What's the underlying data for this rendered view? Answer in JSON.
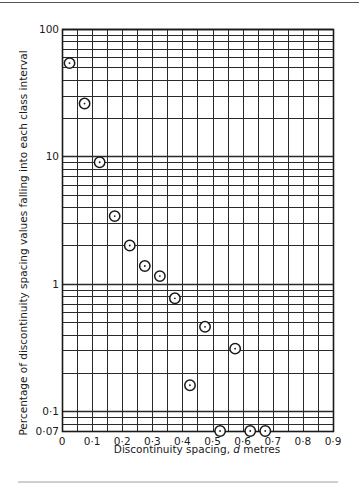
{
  "chart_data": {
    "type": "scatter",
    "title": "",
    "xlabel": "Discontinuity spacing, d metres",
    "xlabel_parts": [
      "Discontinuity spacing, ",
      "d",
      " metres"
    ],
    "ylabel": "Percentage of discontinuity spacing values falling into each class interval",
    "xlim": [
      0,
      0.9
    ],
    "ylim": [
      0.07,
      100
    ],
    "yscale": "log",
    "grid": true,
    "x_ticks": [
      {
        "v": 0,
        "label": "0"
      },
      {
        "v": 0.1,
        "label": "0·1"
      },
      {
        "v": 0.2,
        "label": "0·2"
      },
      {
        "v": 0.3,
        "label": "0·3"
      },
      {
        "v": 0.4,
        "label": "0·4"
      },
      {
        "v": 0.5,
        "label": "0·5"
      },
      {
        "v": 0.6,
        "label": "0·6"
      },
      {
        "v": 0.7,
        "label": "0·7"
      },
      {
        "v": 0.8,
        "label": "0·8"
      },
      {
        "v": 0.9,
        "label": "0·9"
      }
    ],
    "x_minor_step": 0.05,
    "y_ticks": [
      {
        "v": 100,
        "label": "100"
      },
      {
        "v": 10,
        "label": "10"
      },
      {
        "v": 1,
        "label": "1"
      },
      {
        "v": 0.1,
        "label": "0·1"
      },
      {
        "v": 0.07,
        "label": "0·07"
      }
    ],
    "marker": "circled-dot",
    "series": [
      {
        "name": "Discontinuity spacing frequency",
        "points": [
          {
            "x": 0.025,
            "y": 54
          },
          {
            "x": 0.075,
            "y": 26
          },
          {
            "x": 0.125,
            "y": 9.0
          },
          {
            "x": 0.175,
            "y": 3.4
          },
          {
            "x": 0.225,
            "y": 2.0
          },
          {
            "x": 0.275,
            "y": 1.38
          },
          {
            "x": 0.325,
            "y": 1.15
          },
          {
            "x": 0.375,
            "y": 0.77
          },
          {
            "x": 0.425,
            "y": 0.16
          },
          {
            "x": 0.475,
            "y": 0.46
          },
          {
            "x": 0.525,
            "y": 0.07
          },
          {
            "x": 0.575,
            "y": 0.31
          },
          {
            "x": 0.625,
            "y": 0.07
          },
          {
            "x": 0.675,
            "y": 0.07
          }
        ]
      }
    ]
  },
  "colors": {
    "ink": "#1a1a1a",
    "grid": "#2a2a2a",
    "background": "#ffffff"
  }
}
